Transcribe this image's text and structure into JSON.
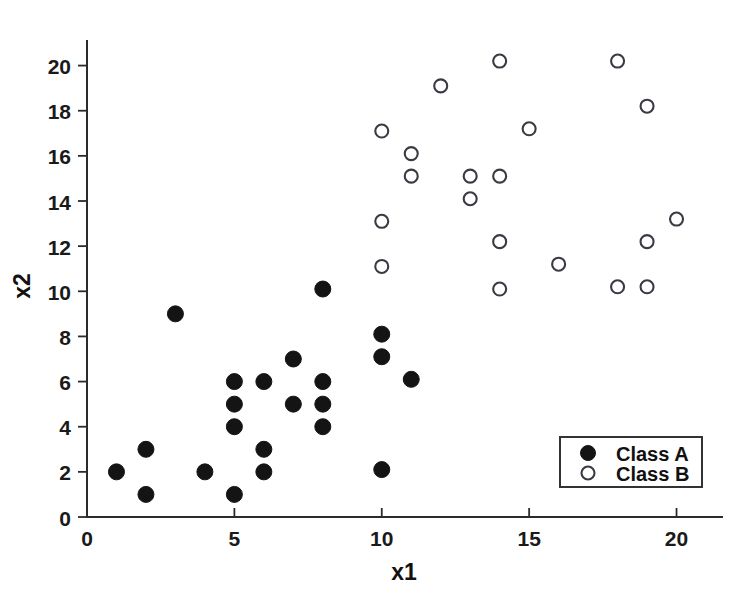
{
  "chart_data": {
    "type": "scatter",
    "title": "",
    "xlabel": "x1",
    "ylabel": "x2",
    "xlim": [
      0,
      21
    ],
    "ylim": [
      0,
      21
    ],
    "xticks": [
      0,
      5,
      10,
      15,
      20
    ],
    "yticks": [
      0,
      2,
      4,
      6,
      8,
      10,
      12,
      14,
      16,
      18,
      20
    ],
    "xticklabels": [
      "0",
      "5",
      "10",
      "15",
      "20"
    ],
    "yticklabels": [
      "0",
      "2",
      "4",
      "6",
      "8",
      "10",
      "12",
      "14",
      "16",
      "18",
      "20"
    ],
    "grid": false,
    "legend_position": "lower right",
    "series": [
      {
        "name": "Class A",
        "marker": "filled-circle",
        "color": "#141414",
        "points": [
          [
            1,
            2.0
          ],
          [
            2,
            3.0
          ],
          [
            2,
            1.0
          ],
          [
            3,
            9.0
          ],
          [
            4,
            2.0
          ],
          [
            5,
            6.0
          ],
          [
            5,
            5.0
          ],
          [
            5,
            4.0
          ],
          [
            5,
            1.0
          ],
          [
            6,
            6.0
          ],
          [
            6,
            3.0
          ],
          [
            6,
            2.0
          ],
          [
            7,
            7.0
          ],
          [
            7,
            5.0
          ],
          [
            8,
            10.1
          ],
          [
            8,
            6.0
          ],
          [
            8,
            5.0
          ],
          [
            8,
            4.0
          ],
          [
            10,
            8.1
          ],
          [
            10,
            7.1
          ],
          [
            10,
            2.1
          ],
          [
            11,
            6.1
          ]
        ]
      },
      {
        "name": "Class B",
        "marker": "open-circle",
        "color": "#3a3a44",
        "points": [
          [
            10,
            17.1
          ],
          [
            10,
            13.1
          ],
          [
            10,
            11.1
          ],
          [
            11,
            16.1
          ],
          [
            11,
            15.1
          ],
          [
            12,
            19.1
          ],
          [
            13,
            15.1
          ],
          [
            13,
            14.1
          ],
          [
            14,
            20.2
          ],
          [
            14,
            15.1
          ],
          [
            14,
            12.2
          ],
          [
            14,
            10.1
          ],
          [
            15,
            17.2
          ],
          [
            16,
            11.2
          ],
          [
            18,
            20.2
          ],
          [
            18,
            10.2
          ],
          [
            19,
            18.2
          ],
          [
            19,
            12.2
          ],
          [
            19,
            10.2
          ],
          [
            20,
            13.2
          ]
        ]
      }
    ]
  },
  "legend": {
    "entries": [
      {
        "label": "Class A",
        "marker": "filled-circle"
      },
      {
        "label": "Class B",
        "marker": "open-circle"
      }
    ]
  },
  "axes": {
    "x_title": "x1",
    "y_title": "x2"
  }
}
